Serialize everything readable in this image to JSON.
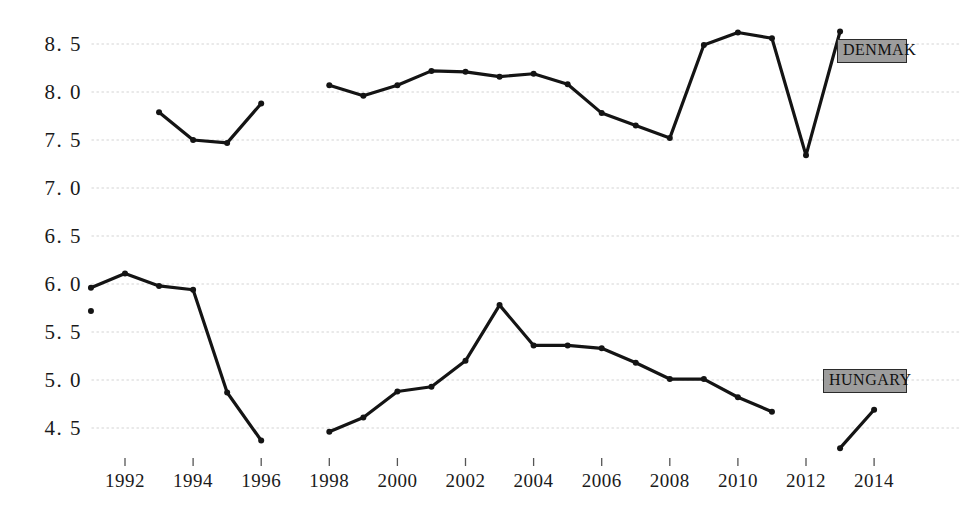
{
  "chart_data": {
    "type": "line",
    "title": "",
    "xlabel": "",
    "ylabel": "",
    "xlim": [
      1990.5,
      2014.8
    ],
    "ylim": [
      4.2,
      8.75
    ],
    "grid": true,
    "grid_axis": "y",
    "legend_position": "inline-right",
    "y_ticks": [
      4.5,
      5.0,
      5.5,
      6.0,
      6.5,
      7.0,
      7.5,
      8.0,
      8.5
    ],
    "y_tick_labels": [
      "4. 5",
      "5. 0",
      "5. 5",
      "6. 0",
      "6. 5",
      "7. 0",
      "7. 5",
      "8. 0",
      "8. 5"
    ],
    "x_ticks": [
      1992,
      1994,
      1996,
      1998,
      2000,
      2002,
      2004,
      2006,
      2008,
      2010,
      2012,
      2014
    ],
    "x_tick_labels": [
      "1992",
      "1994",
      "1996",
      "1998",
      "2000",
      "2002",
      "2004",
      "2006",
      "2008",
      "2010",
      "2012",
      "2014"
    ],
    "series": [
      {
        "name": "DENMAK",
        "color": "#141414",
        "label_fill": "#9d9d9d",
        "label_border": "#2b2b2b",
        "segments": [
          {
            "x": [
              1993,
              1994,
              1995,
              1996
            ],
            "y": [
              7.79,
              7.5,
              7.47,
              7.88
            ]
          },
          {
            "x": [
              1998,
              1999,
              2000,
              2001,
              2002,
              2003,
              2004,
              2005,
              2006,
              2007,
              2008,
              2009,
              2010,
              2011,
              2012,
              2013
            ],
            "y": [
              8.07,
              7.96,
              8.07,
              8.22,
              8.21,
              8.16,
              8.19,
              8.08,
              7.78,
              7.65,
              7.52,
              8.49,
              8.62,
              8.56,
              7.34,
              8.63
            ]
          }
        ]
      },
      {
        "name": "HUNGARY",
        "color": "#141414",
        "label_fill": "#9d9d9d",
        "label_border": "#2b2b2b",
        "isolated_points": [
          {
            "x": 1991,
            "y": 5.72
          }
        ],
        "segments": [
          {
            "x": [
              1991,
              1992,
              1993,
              1994,
              1995,
              1996
            ],
            "y": [
              5.96,
              6.11,
              5.98,
              5.94,
              4.87,
              4.37
            ]
          },
          {
            "x": [
              1998,
              1999,
              2000,
              2001,
              2002,
              2003,
              2004,
              2005,
              2006,
              2007,
              2008,
              2009,
              2010,
              2011
            ],
            "y": [
              4.46,
              4.61,
              4.88,
              4.93,
              5.2,
              5.78,
              5.36,
              5.36,
              5.33,
              5.18,
              5.01,
              5.01,
              4.82,
              4.67
            ]
          },
          {
            "x": [
              2013,
              2014
            ],
            "y": [
              4.29,
              4.69
            ]
          }
        ]
      }
    ],
    "annotations": [
      {
        "name": "denmak-label",
        "text": "DENMAK",
        "x_px": 837,
        "y_px": 39,
        "w_px": 70,
        "h_px": 24
      },
      {
        "name": "hungary-label",
        "text": "HUNGARY",
        "x_px": 823,
        "y_px": 369,
        "w_px": 84,
        "h_px": 24
      }
    ],
    "style": {
      "background": "#ffffff",
      "grid_color": "#e2e2e2",
      "tick_color": "#555555",
      "text_color": "#1a1a1a",
      "line_width": 3.2,
      "marker_size": 3.0
    }
  }
}
